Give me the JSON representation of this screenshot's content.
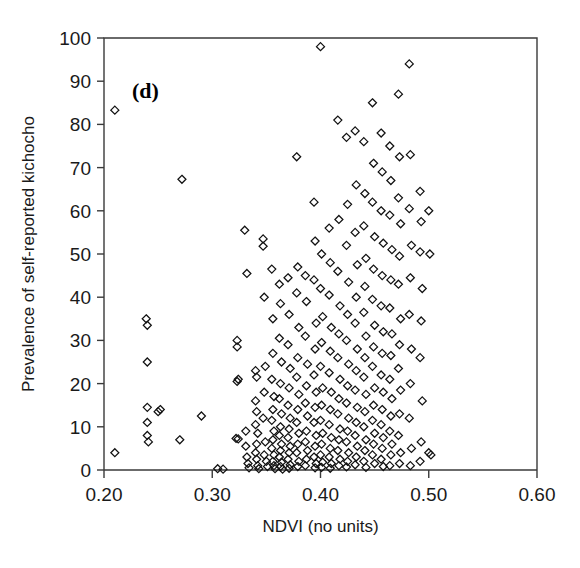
{
  "panel": {
    "label": "(d)"
  },
  "chart_data": {
    "type": "scatter",
    "title": "",
    "panel_label": "(d)",
    "xlabel": "NDVI (no units)",
    "ylabel": "Prevalence of self-reported kichocho",
    "xlim": [
      0.2,
      0.6
    ],
    "ylim": [
      0,
      100
    ],
    "xticks": [
      0.2,
      0.3,
      0.4,
      0.5,
      0.6
    ],
    "xtick_labels": [
      "0.20",
      "0.30",
      "0.40",
      "0.50",
      "0.60"
    ],
    "yticks": [
      0,
      10,
      20,
      30,
      40,
      50,
      60,
      70,
      80,
      90,
      100
    ],
    "ytick_labels": [
      "0",
      "10",
      "20",
      "30",
      "40",
      "50",
      "60",
      "70",
      "80",
      "90",
      "100"
    ],
    "grid": false,
    "legend": null,
    "marker": "open-diamond",
    "marker_color": "#111111",
    "marker_fill": "none",
    "series": [
      {
        "name": "villages",
        "points": [
          [
            0.21,
            83.3
          ],
          [
            0.21,
            4.0
          ],
          [
            0.239,
            35.0
          ],
          [
            0.24,
            33.5
          ],
          [
            0.24,
            25.0
          ],
          [
            0.24,
            14.5
          ],
          [
            0.24,
            11.0
          ],
          [
            0.24,
            8.0
          ],
          [
            0.241,
            6.5
          ],
          [
            0.25,
            13.5
          ],
          [
            0.252,
            14.0
          ],
          [
            0.272,
            67.3
          ],
          [
            0.27,
            7.0
          ],
          [
            0.29,
            12.5
          ],
          [
            0.305,
            0.3
          ],
          [
            0.31,
            0.2
          ],
          [
            0.323,
            30.0
          ],
          [
            0.323,
            28.5
          ],
          [
            0.324,
            21.0
          ],
          [
            0.323,
            20.5
          ],
          [
            0.322,
            7.3
          ],
          [
            0.324,
            7.2
          ],
          [
            0.33,
            55.5
          ],
          [
            0.332,
            45.5
          ],
          [
            0.331,
            9.0
          ],
          [
            0.331,
            5.5
          ],
          [
            0.332,
            3.0
          ],
          [
            0.333,
            1.5
          ],
          [
            0.334,
            0.5
          ],
          [
            0.34,
            23.0
          ],
          [
            0.341,
            21.5
          ],
          [
            0.34,
            16.0
          ],
          [
            0.341,
            13.5
          ],
          [
            0.34,
            10.5
          ],
          [
            0.342,
            8.5
          ],
          [
            0.341,
            6.0
          ],
          [
            0.34,
            4.0
          ],
          [
            0.341,
            2.5
          ],
          [
            0.342,
            1.0
          ],
          [
            0.343,
            0.3
          ],
          [
            0.347,
            53.5
          ],
          [
            0.347,
            51.8
          ],
          [
            0.348,
            40.0
          ],
          [
            0.349,
            24.0
          ],
          [
            0.348,
            18.0
          ],
          [
            0.347,
            12.0
          ],
          [
            0.349,
            6.5
          ],
          [
            0.348,
            3.5
          ],
          [
            0.35,
            2.0
          ],
          [
            0.351,
            0.8
          ],
          [
            0.355,
            46.5
          ],
          [
            0.356,
            35.0
          ],
          [
            0.356,
            27.0
          ],
          [
            0.355,
            21.0
          ],
          [
            0.357,
            17.0
          ],
          [
            0.356,
            14.0
          ],
          [
            0.355,
            11.5
          ],
          [
            0.357,
            9.0
          ],
          [
            0.356,
            7.0
          ],
          [
            0.355,
            5.0
          ],
          [
            0.357,
            3.5
          ],
          [
            0.356,
            2.0
          ],
          [
            0.357,
            1.0
          ],
          [
            0.358,
            0.3
          ],
          [
            0.362,
            43.0
          ],
          [
            0.363,
            38.5
          ],
          [
            0.362,
            30.5
          ],
          [
            0.364,
            25.0
          ],
          [
            0.363,
            20.0
          ],
          [
            0.362,
            16.5
          ],
          [
            0.364,
            13.0
          ],
          [
            0.363,
            10.0
          ],
          [
            0.362,
            8.0
          ],
          [
            0.364,
            6.0
          ],
          [
            0.363,
            4.5
          ],
          [
            0.362,
            3.0
          ],
          [
            0.364,
            1.8
          ],
          [
            0.363,
            0.8
          ],
          [
            0.365,
            0.2
          ],
          [
            0.37,
            44.5
          ],
          [
            0.371,
            36.0
          ],
          [
            0.37,
            29.0
          ],
          [
            0.372,
            23.5
          ],
          [
            0.371,
            19.0
          ],
          [
            0.37,
            15.0
          ],
          [
            0.372,
            12.0
          ],
          [
            0.371,
            9.5
          ],
          [
            0.37,
            7.5
          ],
          [
            0.372,
            5.5
          ],
          [
            0.371,
            4.0
          ],
          [
            0.37,
            2.5
          ],
          [
            0.372,
            1.2
          ],
          [
            0.371,
            0.4
          ],
          [
            0.378,
            72.5
          ],
          [
            0.379,
            47.0
          ],
          [
            0.378,
            41.0
          ],
          [
            0.38,
            33.0
          ],
          [
            0.379,
            26.0
          ],
          [
            0.378,
            21.5
          ],
          [
            0.38,
            17.5
          ],
          [
            0.379,
            14.0
          ],
          [
            0.378,
            11.0
          ],
          [
            0.38,
            8.5
          ],
          [
            0.379,
            6.0
          ],
          [
            0.378,
            4.0
          ],
          [
            0.38,
            2.0
          ],
          [
            0.379,
            0.8
          ],
          [
            0.386,
            45.0
          ],
          [
            0.387,
            39.0
          ],
          [
            0.386,
            31.0
          ],
          [
            0.388,
            24.5
          ],
          [
            0.387,
            19.5
          ],
          [
            0.386,
            15.5
          ],
          [
            0.388,
            12.5
          ],
          [
            0.387,
            9.0
          ],
          [
            0.386,
            6.5
          ],
          [
            0.388,
            4.5
          ],
          [
            0.387,
            2.5
          ],
          [
            0.386,
            1.0
          ],
          [
            0.394,
            62.0
          ],
          [
            0.395,
            53.0
          ],
          [
            0.394,
            44.0
          ],
          [
            0.396,
            34.0
          ],
          [
            0.395,
            28.0
          ],
          [
            0.394,
            22.0
          ],
          [
            0.396,
            18.0
          ],
          [
            0.395,
            14.5
          ],
          [
            0.394,
            11.0
          ],
          [
            0.396,
            8.0
          ],
          [
            0.395,
            5.5
          ],
          [
            0.394,
            3.0
          ],
          [
            0.396,
            1.5
          ],
          [
            0.395,
            0.5
          ],
          [
            0.4,
            98.0
          ],
          [
            0.401,
            50.0
          ],
          [
            0.4,
            42.0
          ],
          [
            0.402,
            35.5
          ],
          [
            0.401,
            29.5
          ],
          [
            0.4,
            24.0
          ],
          [
            0.402,
            19.0
          ],
          [
            0.401,
            15.0
          ],
          [
            0.4,
            11.5
          ],
          [
            0.402,
            8.5
          ],
          [
            0.401,
            6.0
          ],
          [
            0.4,
            3.5
          ],
          [
            0.402,
            1.8
          ],
          [
            0.401,
            0.6
          ],
          [
            0.408,
            56.0
          ],
          [
            0.409,
            48.0
          ],
          [
            0.408,
            40.5
          ],
          [
            0.41,
            33.0
          ],
          [
            0.409,
            27.5
          ],
          [
            0.408,
            22.5
          ],
          [
            0.41,
            18.0
          ],
          [
            0.409,
            14.0
          ],
          [
            0.408,
            10.5
          ],
          [
            0.41,
            7.5
          ],
          [
            0.409,
            5.0
          ],
          [
            0.408,
            3.0
          ],
          [
            0.41,
            1.5
          ],
          [
            0.409,
            0.4
          ],
          [
            0.416,
            81.0
          ],
          [
            0.417,
            58.0
          ],
          [
            0.416,
            46.0
          ],
          [
            0.418,
            38.0
          ],
          [
            0.417,
            31.5
          ],
          [
            0.416,
            26.0
          ],
          [
            0.418,
            21.0
          ],
          [
            0.417,
            16.5
          ],
          [
            0.416,
            13.0
          ],
          [
            0.418,
            9.5
          ],
          [
            0.417,
            7.0
          ],
          [
            0.416,
            4.5
          ],
          [
            0.418,
            2.5
          ],
          [
            0.417,
            1.0
          ],
          [
            0.424,
            77.0
          ],
          [
            0.425,
            61.5
          ],
          [
            0.424,
            52.0
          ],
          [
            0.426,
            43.5
          ],
          [
            0.425,
            36.0
          ],
          [
            0.424,
            30.0
          ],
          [
            0.426,
            24.5
          ],
          [
            0.425,
            19.5
          ],
          [
            0.424,
            15.5
          ],
          [
            0.426,
            12.0
          ],
          [
            0.425,
            9.0
          ],
          [
            0.424,
            6.5
          ],
          [
            0.426,
            4.0
          ],
          [
            0.425,
            2.0
          ],
          [
            0.424,
            0.7
          ],
          [
            0.432,
            78.5
          ],
          [
            0.433,
            66.0
          ],
          [
            0.432,
            55.0
          ],
          [
            0.434,
            47.5
          ],
          [
            0.433,
            40.0
          ],
          [
            0.432,
            34.0
          ],
          [
            0.434,
            28.0
          ],
          [
            0.433,
            23.0
          ],
          [
            0.432,
            18.5
          ],
          [
            0.434,
            14.5
          ],
          [
            0.433,
            11.0
          ],
          [
            0.432,
            8.0
          ],
          [
            0.434,
            5.5
          ],
          [
            0.433,
            3.0
          ],
          [
            0.432,
            1.2
          ],
          [
            0.44,
            76.0
          ],
          [
            0.441,
            64.0
          ],
          [
            0.44,
            56.5
          ],
          [
            0.442,
            49.0
          ],
          [
            0.441,
            42.5
          ],
          [
            0.44,
            36.5
          ],
          [
            0.442,
            31.0
          ],
          [
            0.441,
            26.0
          ],
          [
            0.44,
            21.5
          ],
          [
            0.442,
            17.5
          ],
          [
            0.441,
            13.5
          ],
          [
            0.44,
            10.0
          ],
          [
            0.442,
            7.0
          ],
          [
            0.441,
            4.5
          ],
          [
            0.44,
            2.0
          ],
          [
            0.442,
            0.6
          ],
          [
            0.448,
            85.0
          ],
          [
            0.449,
            71.0
          ],
          [
            0.448,
            62.0
          ],
          [
            0.45,
            54.0
          ],
          [
            0.449,
            46.5
          ],
          [
            0.448,
            39.5
          ],
          [
            0.45,
            33.5
          ],
          [
            0.449,
            28.5
          ],
          [
            0.448,
            24.0
          ],
          [
            0.45,
            19.0
          ],
          [
            0.449,
            15.0
          ],
          [
            0.448,
            11.5
          ],
          [
            0.45,
            8.5
          ],
          [
            0.449,
            6.0
          ],
          [
            0.448,
            3.5
          ],
          [
            0.45,
            1.5
          ],
          [
            0.456,
            78.0
          ],
          [
            0.457,
            69.0
          ],
          [
            0.456,
            60.0
          ],
          [
            0.458,
            52.5
          ],
          [
            0.457,
            45.0
          ],
          [
            0.456,
            38.0
          ],
          [
            0.458,
            32.0
          ],
          [
            0.457,
            27.0
          ],
          [
            0.456,
            22.0
          ],
          [
            0.458,
            18.0
          ],
          [
            0.457,
            14.0
          ],
          [
            0.456,
            10.5
          ],
          [
            0.458,
            7.5
          ],
          [
            0.457,
            5.0
          ],
          [
            0.456,
            2.5
          ],
          [
            0.458,
            0.8
          ],
          [
            0.464,
            75.0
          ],
          [
            0.465,
            67.0
          ],
          [
            0.464,
            59.0
          ],
          [
            0.466,
            51.0
          ],
          [
            0.465,
            44.0
          ],
          [
            0.464,
            37.5
          ],
          [
            0.466,
            31.5
          ],
          [
            0.465,
            26.5
          ],
          [
            0.464,
            21.0
          ],
          [
            0.466,
            16.5
          ],
          [
            0.465,
            12.5
          ],
          [
            0.464,
            9.0
          ],
          [
            0.466,
            6.0
          ],
          [
            0.465,
            3.5
          ],
          [
            0.464,
            1.0
          ],
          [
            0.472,
            87.0
          ],
          [
            0.473,
            72.5
          ],
          [
            0.472,
            63.0
          ],
          [
            0.474,
            57.0
          ],
          [
            0.473,
            49.5
          ],
          [
            0.472,
            43.0
          ],
          [
            0.474,
            35.0
          ],
          [
            0.473,
            29.0
          ],
          [
            0.472,
            23.5
          ],
          [
            0.474,
            18.5
          ],
          [
            0.473,
            13.0
          ],
          [
            0.472,
            8.0
          ],
          [
            0.474,
            4.0
          ],
          [
            0.473,
            1.5
          ],
          [
            0.482,
            94.0
          ],
          [
            0.483,
            73.0
          ],
          [
            0.482,
            60.5
          ],
          [
            0.484,
            52.0
          ],
          [
            0.483,
            44.5
          ],
          [
            0.482,
            36.0
          ],
          [
            0.484,
            28.0
          ],
          [
            0.483,
            20.0
          ],
          [
            0.482,
            12.0
          ],
          [
            0.484,
            5.0
          ],
          [
            0.483,
            1.0
          ],
          [
            0.492,
            64.5
          ],
          [
            0.493,
            57.5
          ],
          [
            0.492,
            50.5
          ],
          [
            0.494,
            42.0
          ],
          [
            0.493,
            34.5
          ],
          [
            0.492,
            26.0
          ],
          [
            0.494,
            16.0
          ],
          [
            0.493,
            6.5
          ],
          [
            0.492,
            2.0
          ],
          [
            0.5,
            60.0
          ],
          [
            0.501,
            50.0
          ],
          [
            0.5,
            4.0
          ],
          [
            0.502,
            3.5
          ]
        ]
      }
    ]
  },
  "axes": {
    "x_title": "NDVI (no units)",
    "y_title": "Prevalence of self-reported kichocho"
  }
}
